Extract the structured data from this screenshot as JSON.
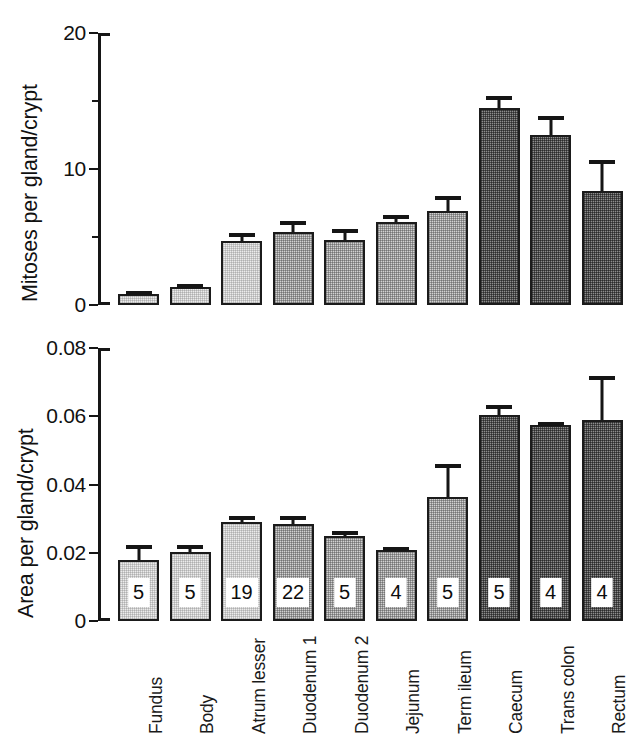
{
  "figure": {
    "categories": [
      "Fundus",
      "Body",
      "Atrum lesser",
      "Duodenum 1",
      "Duodenum 2",
      "Jejunum",
      "Term ileum",
      "Caecum",
      "Trans colon",
      "Rectum"
    ],
    "shades": [
      "light",
      "light",
      "light",
      "mid",
      "mid",
      "mid",
      "mid",
      "dark",
      "dark",
      "dark"
    ],
    "colors": {
      "light_fill": "#ececec",
      "mid_fill": "#d2d2d2",
      "dark_fill": "#8d8d8d",
      "outline": "#1b1b1b",
      "text": "#111111",
      "background": "#ffffff"
    }
  },
  "chart_data": [
    {
      "type": "bar",
      "id": "mitoses-panel",
      "title": "",
      "xlabel": "",
      "ylabel": "Mitoses per gland/crypt",
      "ylim": [
        0,
        20
      ],
      "yticks": [
        0,
        10,
        20
      ],
      "ytick_labels": [
        "0",
        "10",
        "20"
      ],
      "yminor_ticks": [
        5,
        15
      ],
      "grid": false,
      "legend": "none",
      "categories": [
        "Fundus",
        "Body",
        "Atrum lesser",
        "Duodenum 1",
        "Duodenum 2",
        "Jejunum",
        "Term ileum",
        "Caecum",
        "Trans colon",
        "Rectum"
      ],
      "values": [
        0.8,
        1.3,
        4.7,
        5.4,
        4.8,
        6.1,
        6.9,
        14.5,
        12.5,
        8.4
      ],
      "errors_upper": [
        0.2,
        0.25,
        0.6,
        0.75,
        0.8,
        0.55,
        1.1,
        0.9,
        1.4,
        2.3
      ]
    },
    {
      "type": "bar",
      "id": "area-panel",
      "title": "",
      "xlabel": "",
      "ylabel": "Area per gland/crypt",
      "ylim": [
        0,
        0.08
      ],
      "yticks": [
        0,
        0.02,
        0.04,
        0.06,
        0.08
      ],
      "ytick_labels": [
        "0",
        "0.02",
        "0.04",
        "0.06",
        "0.08"
      ],
      "grid": false,
      "legend": "none",
      "categories": [
        "Fundus",
        "Body",
        "Atrum lesser",
        "Duodenum 1",
        "Duodenum 2",
        "Jejunum",
        "Term ileum",
        "Caecum",
        "Trans colon",
        "Rectum"
      ],
      "values": [
        0.018,
        0.0203,
        0.029,
        0.0285,
        0.0249,
        0.0209,
        0.0362,
        0.0605,
        0.0575,
        0.059
      ],
      "errors_upper": [
        0.0042,
        0.0019,
        0.0017,
        0.0022,
        0.0014,
        0.0009,
        0.0099,
        0.0027,
        0.0005,
        0.0127
      ],
      "point_labels": [
        "5",
        "5",
        "19",
        "22",
        "5",
        "4",
        "5",
        "5",
        "4",
        "4"
      ],
      "point_labels_meaning": "n"
    }
  ]
}
